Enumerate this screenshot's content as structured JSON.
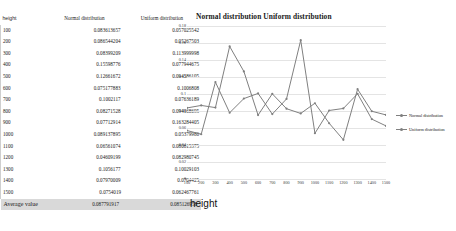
{
  "table": {
    "headers": {
      "height": "height",
      "normal": "Normal distribution",
      "uniform": "Uniform distribution"
    },
    "rows": [
      {
        "height": "100",
        "normal": "0.083613657",
        "uniform": "0.057025542"
      },
      {
        "height": "200",
        "normal": "0.086544204",
        "uniform": "0.05267503"
      },
      {
        "height": "300",
        "normal": "0.08399209",
        "uniform": "0.113999998"
      },
      {
        "height": "400",
        "normal": "0.15598776",
        "uniform": "0.077944675"
      },
      {
        "height": "500",
        "normal": "0.12661672",
        "uniform": "0.094586105"
      },
      {
        "height": "600",
        "normal": "0.075177883",
        "uniform": "0.1006808"
      },
      {
        "height": "700",
        "normal": "0.1002117",
        "uniform": "0.07636189"
      },
      {
        "height": "800",
        "normal": "0.08271528",
        "uniform": "0.094168695"
      },
      {
        "height": "900",
        "normal": "0.07712914",
        "uniform": "0.163284405"
      },
      {
        "height": "1000",
        "normal": "0.089137895",
        "uniform": "0.05379986"
      },
      {
        "height": "1100",
        "normal": "0.06561074",
        "uniform": "0.080615375"
      },
      {
        "height": "1200",
        "normal": "0.04609199",
        "uniform": "0.082980745"
      },
      {
        "height": "1300",
        "normal": "0.1056177",
        "uniform": "0.10029103"
      },
      {
        "height": "1400",
        "normal": "0.07970009",
        "uniform": "0.0704425"
      },
      {
        "height": "1500",
        "normal": "0.0754019",
        "uniform": "0.062467761"
      }
    ],
    "footer": {
      "label": "Average value",
      "normal": "0.087791917",
      "uniform": "0.085126958"
    }
  },
  "chart_data": {
    "type": "line",
    "title": "Normal distribution Uniform distribution",
    "xlabel": "height",
    "ylabel": "",
    "x": [
      100,
      200,
      300,
      400,
      500,
      600,
      700,
      800,
      900,
      1000,
      1100,
      1200,
      1300,
      1400,
      1500
    ],
    "categories": [
      "100",
      "200",
      "300",
      "400",
      "500",
      "600",
      "700",
      "800",
      "900",
      "1000",
      "1100",
      "1200",
      "1300",
      "1400",
      "1500"
    ],
    "series": [
      {
        "name": "Normal distribution",
        "color": "#7f7f7f",
        "values": [
          0.083613657,
          0.086544204,
          0.08399209,
          0.15598776,
          0.12661672,
          0.075177883,
          0.1002117,
          0.08271528,
          0.07712914,
          0.089137895,
          0.06561074,
          0.04609199,
          0.1056177,
          0.07970009,
          0.0754019
        ]
      },
      {
        "name": "Uniform distribution",
        "color": "#808080",
        "values": [
          0.057025542,
          0.05267503,
          0.113999998,
          0.077944675,
          0.094586105,
          0.1006808,
          0.07636189,
          0.094168695,
          0.163284405,
          0.05379986,
          0.080615375,
          0.082980745,
          0.10029103,
          0.0704425,
          0.062467761
        ]
      }
    ],
    "ylim": [
      0,
      0.18
    ],
    "ytick_labels": [
      "0.18",
      "0.16",
      "0.14",
      "0.12",
      "0.1",
      "0.08",
      "0.06",
      "0.04",
      "0.02",
      "0"
    ],
    "yticks": [
      0.18,
      0.16,
      0.14,
      0.12,
      0.1,
      0.08,
      0.06,
      0.04,
      0.02,
      0
    ],
    "grid": true,
    "legend_position": "right"
  }
}
